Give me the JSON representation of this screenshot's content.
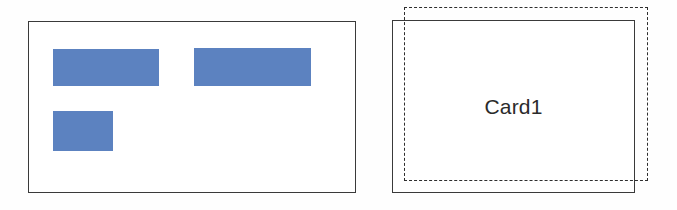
{
  "diagram": {
    "background_color": "#fefefe",
    "stroke_color": "#3a3a3a",
    "accent_color": "#5c82c0",
    "left_panel": {
      "name": "content-container",
      "blocks": [
        {
          "label": "block-1",
          "color": "#5c82c0"
        },
        {
          "label": "block-2",
          "color": "#5c82c0"
        },
        {
          "label": "block-3",
          "color": "#5c82c0"
        }
      ]
    },
    "right_panel": {
      "name": "card-container",
      "card_label": "Card1",
      "solid_frame_label": "card-bounds",
      "dashed_frame_label": "card-outline-offset",
      "dashed_stroke_color": "#2e2e2e"
    }
  }
}
